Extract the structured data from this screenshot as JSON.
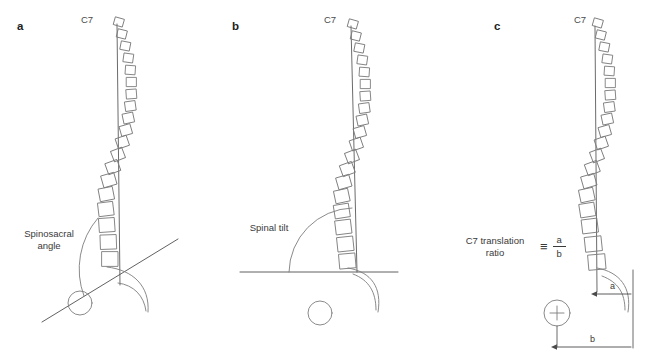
{
  "figure": {
    "type": "line-diagram",
    "background": "#ffffff",
    "stroke_color": "#7d7d7d",
    "text_color": "#3a3a3a",
    "panel_count": 3
  },
  "panels": [
    {
      "letter": "a",
      "name": "spinosacral-angle",
      "vertebra_label": "C7",
      "annotation": "Spinosacral\nangle",
      "annotation_line1": "Spinosacral",
      "annotation_line2": "angle",
      "elements": [
        "c7-plumb-line",
        "vertebral-column",
        "sacral-endplate-line",
        "femoral-head-circle",
        "angle-arc",
        "sacrum-curve"
      ]
    },
    {
      "letter": "b",
      "name": "spinal-tilt",
      "vertebra_label": "C7",
      "annotation": "Spinal tilt",
      "annotation_line1": "Spinal tilt",
      "annotation_line2": "",
      "elements": [
        "c7-plumb-line",
        "vertebral-column",
        "horizontal-reference-line",
        "femoral-head-circle",
        "angle-arc",
        "sacrum-curve"
      ]
    },
    {
      "letter": "c",
      "name": "c7-translation-ratio",
      "vertebra_label": "C7",
      "annotation_line1": "C7 translation",
      "annotation_line2": "ratio",
      "equals_sign": "≡",
      "numerator": "a",
      "denominator": "b",
      "measure_a_label": "a",
      "measure_b_label": "b",
      "elements": [
        "c7-plumb-line",
        "vertebral-column",
        "femoral-head-circle-crosshair",
        "measure-a-arrow",
        "measure-b-arrow",
        "sacrum-curve"
      ]
    }
  ]
}
